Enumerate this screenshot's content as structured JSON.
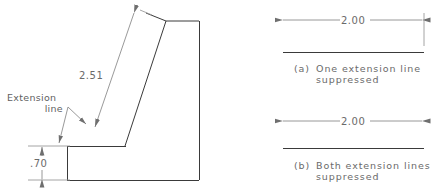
{
  "figure": {
    "background_color": "#ffffff",
    "object_line_color": "#3a3a3a",
    "dimension_line_color": "#8d8d8d",
    "text_color": "#6a6a6a"
  },
  "left_drawing": {
    "name": "part-outline-drawing",
    "slant_dimension": {
      "value": "2.51",
      "type": "aligned-linear",
      "arrowheads": "both-ends"
    },
    "height_dimension": {
      "value": ".70",
      "type": "vertical-linear",
      "arrowheads": "both-ends"
    },
    "annotation": {
      "line1": "Extension",
      "line2": "line",
      "leaders": 2
    }
  },
  "right_panel": {
    "examples": [
      {
        "id": "a",
        "dimension_value": "2.00",
        "marker": "(a)",
        "caption_line1": "One extension line",
        "caption_line2": "suppressed",
        "extension_lines_shown": 1,
        "suppressed_side": "left"
      },
      {
        "id": "b",
        "dimension_value": "2.00",
        "marker": "(b)",
        "caption_line1": "Both extension lines",
        "caption_line2": "suppressed",
        "extension_lines_shown": 0,
        "suppressed_side": "both"
      }
    ]
  }
}
